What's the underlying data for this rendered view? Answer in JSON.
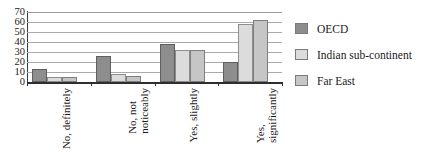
{
  "chart_data": {
    "type": "bar",
    "title": "",
    "subtitle": "",
    "xlabel": "",
    "ylabel": "",
    "ylim": [
      0,
      70
    ],
    "ytick_step": 10,
    "yticks": [
      "70",
      "60",
      "50",
      "40",
      "30",
      "20",
      "10",
      "0"
    ],
    "grid": "horizontal",
    "legend_position": "right",
    "categories": [
      "No, definitely",
      "No, not noticeably",
      "Yes, slightly",
      "Yes, significantly"
    ],
    "category_lines": [
      [
        "No, definitely"
      ],
      [
        "No, not",
        "noticeably"
      ],
      [
        "Yes, slightly"
      ],
      [
        "Yes,",
        "significantly"
      ]
    ],
    "series": [
      {
        "name": "OECD",
        "color": "#8d8d8d",
        "values": [
          13,
          26,
          38,
          20
        ]
      },
      {
        "name": "Indian sub-continent",
        "color": "#dcdcdc",
        "values": [
          5,
          8,
          32,
          58
        ]
      },
      {
        "name": "Far East",
        "color": "#c6c6c6",
        "values": [
          5,
          6,
          32,
          62
        ]
      }
    ]
  },
  "legend": {
    "items": [
      {
        "label": "OECD",
        "swatch": "#8d8d8d"
      },
      {
        "label": "Indian sub-continent",
        "swatch": "#dcdcdc"
      },
      {
        "label": "Far East",
        "swatch": "#c6c6c6"
      }
    ]
  },
  "top_clip": {
    "text": ""
  }
}
